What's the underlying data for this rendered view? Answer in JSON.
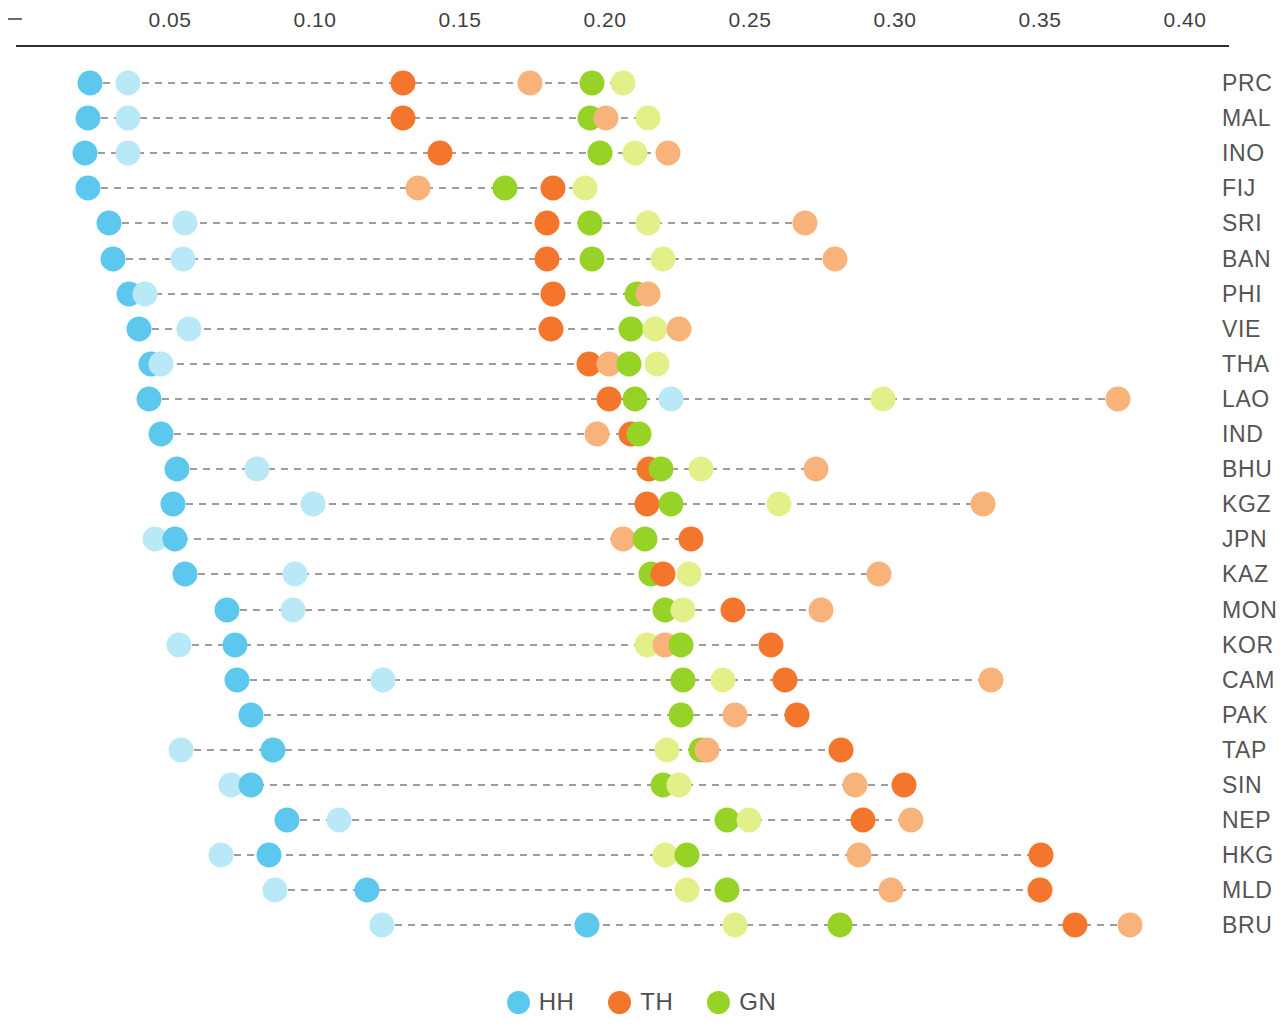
{
  "chart_data": {
    "type": "scatter",
    "title": "",
    "subtitle": "",
    "xlabel": "",
    "ylabel": "",
    "xlim": [
      0.0,
      0.415
    ],
    "grid": false,
    "legend_position": "bottom",
    "axis": {
      "tick_labels": [
        "0.05",
        "0.10",
        "0.15",
        "0.20",
        "0.25",
        "0.30",
        "0.35",
        "0.40"
      ],
      "tick_values": [
        0.05,
        0.1,
        0.15,
        0.2,
        0.25,
        0.3,
        0.35,
        0.4
      ],
      "origin_marker": "–"
    },
    "legend": [
      {
        "name": "HH",
        "color": "#5cc8ee"
      },
      {
        "name": "TH",
        "color": "#f4762c"
      },
      {
        "name": "GN",
        "color": "#96d326"
      }
    ],
    "series_colors": {
      "HH": "#5cc8ee",
      "HH_light": "#b9e8f7",
      "TH": "#f4762c",
      "TH_light": "#f7b37a",
      "GN": "#96d326",
      "GN_light": "#e3f08a"
    },
    "categories": [
      "PRC",
      "MAL",
      "INO",
      "FIJ",
      "SRI",
      "BAN",
      "PHI",
      "VIE",
      "THA",
      "LAO",
      "IND",
      "BHU",
      "KGZ",
      "JPN",
      "KAZ",
      "MON",
      "KOR",
      "CAM",
      "PAK",
      "TAP",
      "SIN",
      "NEP",
      "HKG",
      "MLD",
      "BRU"
    ],
    "rows": [
      {
        "label": "PRC",
        "points": [
          {
            "s": "HH",
            "v": 0.0224
          },
          {
            "s": "HH_light",
            "v": 0.0355
          },
          {
            "s": "TH",
            "v": 0.1303
          },
          {
            "s": "TH_light",
            "v": 0.1741
          },
          {
            "s": "GN",
            "v": 0.1955
          },
          {
            "s": "GN_light",
            "v": 0.2062
          }
        ]
      },
      {
        "label": "MAL",
        "points": [
          {
            "s": "HH",
            "v": 0.0217
          },
          {
            "s": "HH_light",
            "v": 0.0355
          },
          {
            "s": "TH",
            "v": 0.1303
          },
          {
            "s": "GN",
            "v": 0.1948
          },
          {
            "s": "TH_light",
            "v": 0.2003
          },
          {
            "s": "GN_light",
            "v": 0.2148
          }
        ]
      },
      {
        "label": "INO",
        "points": [
          {
            "s": "HH",
            "v": 0.0207
          },
          {
            "s": "HH_light",
            "v": 0.0355
          },
          {
            "s": "TH",
            "v": 0.1431
          },
          {
            "s": "GN",
            "v": 0.1983
          },
          {
            "s": "GN_light",
            "v": 0.2103
          },
          {
            "s": "TH_light",
            "v": 0.2217
          }
        ]
      },
      {
        "label": "FIJ",
        "points": [
          {
            "s": "HH",
            "v": 0.0217
          },
          {
            "s": "TH_light",
            "v": 0.1355
          },
          {
            "s": "GN",
            "v": 0.1655
          },
          {
            "s": "TH",
            "v": 0.1821
          },
          {
            "s": "GN_light",
            "v": 0.1931
          }
        ]
      },
      {
        "label": "SRI",
        "points": [
          {
            "s": "HH",
            "v": 0.029
          },
          {
            "s": "HH_light",
            "v": 0.0552
          },
          {
            "s": "TH",
            "v": 0.18
          },
          {
            "s": "GN",
            "v": 0.1948
          },
          {
            "s": "GN_light",
            "v": 0.2148
          },
          {
            "s": "TH_light",
            "v": 0.269
          }
        ]
      },
      {
        "label": "BAN",
        "points": [
          {
            "s": "HH",
            "v": 0.0303
          },
          {
            "s": "HH_light",
            "v": 0.0545
          },
          {
            "s": "TH",
            "v": 0.18
          },
          {
            "s": "GN",
            "v": 0.1955
          },
          {
            "s": "GN_light",
            "v": 0.22
          },
          {
            "s": "TH_light",
            "v": 0.2793
          }
        ]
      },
      {
        "label": "PHI",
        "points": [
          {
            "s": "HH",
            "v": 0.0359
          },
          {
            "s": "HH_light",
            "v": 0.0414
          },
          {
            "s": "TH",
            "v": 0.1821
          },
          {
            "s": "GN",
            "v": 0.211
          },
          {
            "s": "TH_light",
            "v": 0.2148
          }
        ]
      },
      {
        "label": "VIE",
        "points": [
          {
            "s": "HH",
            "v": 0.0393
          },
          {
            "s": "HH_light",
            "v": 0.0566
          },
          {
            "s": "TH",
            "v": 0.1814
          },
          {
            "s": "GN",
            "v": 0.209
          },
          {
            "s": "GN_light",
            "v": 0.2172
          },
          {
            "s": "TH_light",
            "v": 0.2255
          }
        ]
      },
      {
        "label": "THA",
        "points": [
          {
            "s": "HH",
            "v": 0.0434
          },
          {
            "s": "HH_light",
            "v": 0.0469
          },
          {
            "s": "TH",
            "v": 0.1945
          },
          {
            "s": "TH_light",
            "v": 0.2014
          },
          {
            "s": "GN",
            "v": 0.2083
          },
          {
            "s": "GN_light",
            "v": 0.2179
          }
        ]
      },
      {
        "label": "LAO",
        "points": [
          {
            "s": "HH",
            "v": 0.0428
          },
          {
            "s": "TH",
            "v": 0.2014
          },
          {
            "s": "GN",
            "v": 0.2103
          },
          {
            "s": "HH_light",
            "v": 0.2228
          },
          {
            "s": "GN_light",
            "v": 0.2959
          },
          {
            "s": "TH_light",
            "v": 0.3769
          }
        ]
      },
      {
        "label": "IND",
        "points": [
          {
            "s": "HH",
            "v": 0.0469
          },
          {
            "s": "TH_light",
            "v": 0.1972
          },
          {
            "s": "TH",
            "v": 0.209
          },
          {
            "s": "GN",
            "v": 0.2117
          }
        ]
      },
      {
        "label": "BHU",
        "points": [
          {
            "s": "HH",
            "v": 0.0524
          },
          {
            "s": "HH_light",
            "v": 0.08
          },
          {
            "s": "TH",
            "v": 0.2152
          },
          {
            "s": "GN",
            "v": 0.2193
          },
          {
            "s": "GN_light",
            "v": 0.2331
          },
          {
            "s": "TH_light",
            "v": 0.2728
          }
        ]
      },
      {
        "label": "KGZ",
        "points": [
          {
            "s": "HH",
            "v": 0.051
          },
          {
            "s": "HH_light",
            "v": 0.0993
          },
          {
            "s": "TH",
            "v": 0.2145
          },
          {
            "s": "GN",
            "v": 0.2228
          },
          {
            "s": "GN_light",
            "v": 0.26
          },
          {
            "s": "TH_light",
            "v": 0.3303
          }
        ]
      },
      {
        "label": "JPN",
        "points": [
          {
            "s": "HH_light",
            "v": 0.0448
          },
          {
            "s": "HH",
            "v": 0.0517
          },
          {
            "s": "TH_light",
            "v": 0.2062
          },
          {
            "s": "GN",
            "v": 0.2138
          },
          {
            "s": "TH",
            "v": 0.2296
          }
        ]
      },
      {
        "label": "KAZ",
        "points": [
          {
            "s": "HH",
            "v": 0.0552
          },
          {
            "s": "HH_light",
            "v": 0.0931
          },
          {
            "s": "GN",
            "v": 0.2159
          },
          {
            "s": "TH",
            "v": 0.22
          },
          {
            "s": "GN_light",
            "v": 0.229
          },
          {
            "s": "TH_light",
            "v": 0.2945
          }
        ]
      },
      {
        "label": "MON",
        "points": [
          {
            "s": "HH",
            "v": 0.0697
          },
          {
            "s": "HH_light",
            "v": 0.0924
          },
          {
            "s": "GN",
            "v": 0.2207
          },
          {
            "s": "GN_light",
            "v": 0.2269
          },
          {
            "s": "TH",
            "v": 0.2441
          },
          {
            "s": "TH_light",
            "v": 0.2745
          }
        ]
      },
      {
        "label": "KOR",
        "points": [
          {
            "s": "HH_light",
            "v": 0.0531
          },
          {
            "s": "HH",
            "v": 0.0724
          },
          {
            "s": "GN_light",
            "v": 0.2145
          },
          {
            "s": "TH_light",
            "v": 0.2207
          },
          {
            "s": "GN",
            "v": 0.2262
          },
          {
            "s": "TH",
            "v": 0.2572
          }
        ]
      },
      {
        "label": "CAM",
        "points": [
          {
            "s": "HH",
            "v": 0.0731
          },
          {
            "s": "HH_light",
            "v": 0.1234
          },
          {
            "s": "GN",
            "v": 0.2269
          },
          {
            "s": "GN_light",
            "v": 0.2407
          },
          {
            "s": "TH",
            "v": 0.2621
          },
          {
            "s": "TH_light",
            "v": 0.3331
          }
        ]
      },
      {
        "label": "PAK",
        "points": [
          {
            "s": "HH",
            "v": 0.0779
          },
          {
            "s": "GN",
            "v": 0.2262
          },
          {
            "s": "TH_light",
            "v": 0.2448
          },
          {
            "s": "TH",
            "v": 0.2662
          }
        ]
      },
      {
        "label": "TAP",
        "points": [
          {
            "s": "HH_light",
            "v": 0.0538
          },
          {
            "s": "HH",
            "v": 0.0855
          },
          {
            "s": "GN_light",
            "v": 0.2214
          },
          {
            "s": "GN",
            "v": 0.2331
          },
          {
            "s": "TH_light",
            "v": 0.2352
          },
          {
            "s": "TH",
            "v": 0.2814
          }
        ]
      },
      {
        "label": "SIN",
        "points": [
          {
            "s": "HH_light",
            "v": 0.071
          },
          {
            "s": "HH",
            "v": 0.0779
          },
          {
            "s": "GN",
            "v": 0.22
          },
          {
            "s": "GN_light",
            "v": 0.2255
          },
          {
            "s": "TH_light",
            "v": 0.2862
          },
          {
            "s": "TH",
            "v": 0.3031
          }
        ]
      },
      {
        "label": "NEP",
        "points": [
          {
            "s": "HH",
            "v": 0.0903
          },
          {
            "s": "HH_light",
            "v": 0.1083
          },
          {
            "s": "GN",
            "v": 0.2421
          },
          {
            "s": "GN_light",
            "v": 0.2496
          },
          {
            "s": "TH",
            "v": 0.289
          },
          {
            "s": "TH_light",
            "v": 0.3055
          }
        ]
      },
      {
        "label": "HKG",
        "points": [
          {
            "s": "HH_light",
            "v": 0.0676
          },
          {
            "s": "HH",
            "v": 0.0841
          },
          {
            "s": "GN_light",
            "v": 0.2207
          },
          {
            "s": "GN",
            "v": 0.2283
          },
          {
            "s": "TH_light",
            "v": 0.2876
          },
          {
            "s": "TH",
            "v": 0.3503
          }
        ]
      },
      {
        "label": "MLD",
        "points": [
          {
            "s": "HH_light",
            "v": 0.0862
          },
          {
            "s": "HH",
            "v": 0.1179
          },
          {
            "s": "GN_light",
            "v": 0.2283
          },
          {
            "s": "GN",
            "v": 0.2421
          },
          {
            "s": "TH_light",
            "v": 0.2986
          },
          {
            "s": "TH",
            "v": 0.35
          }
        ]
      },
      {
        "label": "BRU",
        "points": [
          {
            "s": "HH_light",
            "v": 0.1231
          },
          {
            "s": "HH",
            "v": 0.1938
          },
          {
            "s": "GN_light",
            "v": 0.2448
          },
          {
            "s": "GN",
            "v": 0.281
          },
          {
            "s": "TH",
            "v": 0.3621
          },
          {
            "s": "TH_light",
            "v": 0.381
          }
        ]
      }
    ]
  }
}
